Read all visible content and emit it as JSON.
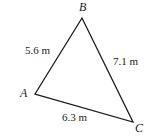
{
  "figure": {
    "type": "triangle-diagram",
    "background_color": "#ffffff",
    "stroke_color": "#1a1a1a",
    "text_color": "#1a1a1a",
    "stroke_width": 1.3,
    "units": "m"
  },
  "vertices": [
    {
      "name": "B",
      "label": "B",
      "x": 82,
      "y": 18,
      "label_x": 79,
      "label_y": 1
    },
    {
      "name": "A",
      "label": "A",
      "x": 35,
      "y": 94,
      "label_x": 20,
      "label_y": 87
    },
    {
      "name": "C",
      "label": "C",
      "x": 133,
      "y": 122,
      "label_x": 135,
      "label_y": 122
    }
  ],
  "sides": [
    {
      "name": "AB",
      "label": "5.6 m",
      "value": 5.6,
      "from": "A",
      "to": "B",
      "label_x": 25,
      "label_y": 45
    },
    {
      "name": "BC",
      "label": "7.1 m",
      "value": 7.1,
      "from": "B",
      "to": "C",
      "label_x": 113,
      "label_y": 56
    },
    {
      "name": "AC",
      "label": "6.3 m",
      "value": 6.3,
      "from": "A",
      "to": "C",
      "label_x": 62,
      "label_y": 112
    }
  ],
  "chart_data": {
    "type": "diagram",
    "title": "",
    "categories": [
      "AB",
      "BC",
      "AC"
    ],
    "values": [
      5.6,
      7.1,
      6.3
    ],
    "tick_labels": [
      "5.6 m",
      "7.1 m",
      "6.3 m"
    ],
    "annotations": [
      "A",
      "B",
      "C"
    ],
    "xlabel": "",
    "ylabel": ""
  }
}
